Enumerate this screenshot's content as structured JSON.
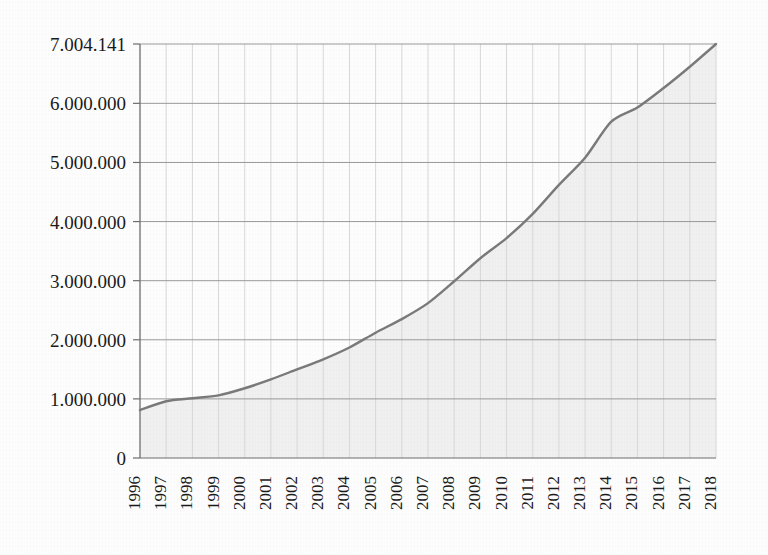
{
  "chart_data": {
    "type": "area",
    "title": "",
    "subtitle": "",
    "xlabel": "",
    "ylabel": "",
    "grid": true,
    "legend": false,
    "legend_position": "none",
    "x": [
      1996,
      1997,
      1998,
      1999,
      2000,
      2001,
      2002,
      2003,
      2004,
      2005,
      2006,
      2007,
      2008,
      2009,
      2010,
      2011,
      2012,
      2013,
      2014,
      2015,
      2016,
      2017,
      2018
    ],
    "categories": [
      "1996",
      "1997",
      "1998",
      "1999",
      "2000",
      "2001",
      "2002",
      "2003",
      "2004",
      "2005",
      "2006",
      "2007",
      "2008",
      "2009",
      "2010",
      "2011",
      "2012",
      "2013",
      "2014",
      "2015",
      "2016",
      "2017",
      "2018"
    ],
    "values": [
      810000,
      960000,
      1010000,
      1060000,
      1180000,
      1330000,
      1500000,
      1670000,
      1870000,
      2120000,
      2350000,
      2620000,
      2990000,
      3380000,
      3720000,
      4130000,
      4620000,
      5080000,
      5690000,
      5930000,
      6260000,
      6620000,
      7004141
    ],
    "series": [
      {
        "name": "Cumulative total",
        "values": [
          810000,
          960000,
          1010000,
          1060000,
          1180000,
          1330000,
          1500000,
          1670000,
          1870000,
          2120000,
          2350000,
          2620000,
          2990000,
          3380000,
          3720000,
          4130000,
          4620000,
          5080000,
          5690000,
          5930000,
          6260000,
          6620000,
          7004141
        ]
      }
    ],
    "ylim": [
      0,
      7004141
    ],
    "xlim": [
      1996,
      2018
    ],
    "ytick_values": [
      0,
      1000000,
      2000000,
      3000000,
      4000000,
      5000000,
      6000000,
      7004141
    ],
    "ytick_labels": [
      "0",
      "1.000.000",
      "2.000.000",
      "3.000.000",
      "4.000.000",
      "5.000.000",
      "6.000.000",
      "7.004.141"
    ],
    "final_value_label": "7.004.141",
    "decimal_separator_style": "dot-thousands",
    "colors": {
      "line": "#7a7a7a",
      "area_fill": "#f0f0f0",
      "grid_major": "#9a9a9a",
      "grid_minor": "#d8d8d8",
      "axis": "#6e6e6e",
      "text": "#1a1a1a",
      "background": "#fdfdfd"
    }
  }
}
